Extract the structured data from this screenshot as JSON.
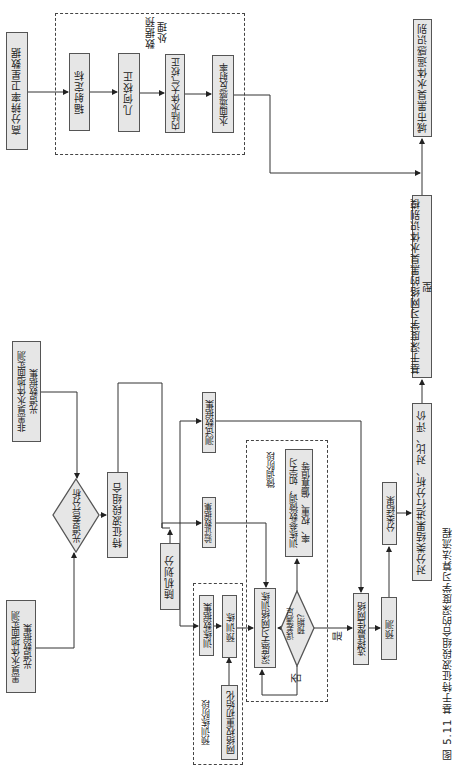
{
  "figure": {
    "caption": "图 5.11 基于特征波段组合的深度学习算法流程",
    "orientation": "rotated 90° clockwise"
  },
  "nodes": {
    "satellite_data": "高分辨率卫星数据",
    "preprocess_group_label": "数据预\n处理",
    "radiometric_calibration": "辐射定标",
    "geometric_correction": "几何校正",
    "atmospheric_correction": "内陆水体大气校正",
    "water_reflectance": "水面遥感反射率",
    "urban_identification": "城市黑臭水体遥感识别",
    "dl_model": "基于深度学习网络的黑臭水体识别模型",
    "analysis": "对分类结果进行分析、对比、评价",
    "non_black_odorous_dataset": "非黑臭水体地面实测\n光谱数据集",
    "black_odorous_dataset": "黑臭水体地面实测\n光谱数据集",
    "spectral_difference": "光谱差异分析",
    "feature_band_combination": "特征波段组合",
    "random_split": "随机划分",
    "test_dataset": "测试数据集",
    "validation_dataset": "验证数据集",
    "train_dataset": "训练数据集",
    "pretrain": "预训练",
    "weight_init": "网络权重初始化",
    "pretrain_group_label": "预训练阶段",
    "finetune_group_label": "微调阶段",
    "dl_training": "深度学习网络训练",
    "error_check": "误差满足\n预期?",
    "param_finetune": "训练参数微调，如学习\n率、权重、偏置值等",
    "select_best": "选择最佳网络",
    "predict": "预测",
    "classification_result": "分类结果",
    "yes_label": "是",
    "no_label": "否"
  },
  "colors": {
    "box_fill": "#e6e6e6",
    "box_border": "#555555",
    "line": "#333333"
  }
}
